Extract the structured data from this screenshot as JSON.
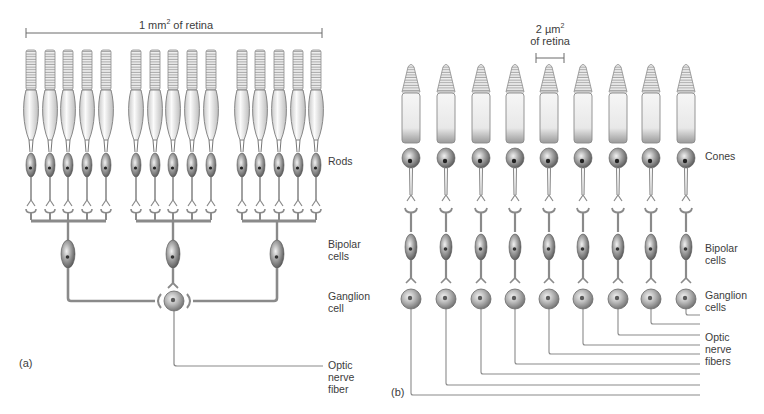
{
  "panel_a": {
    "letter": "(a)",
    "scale_label_prefix": "1 mm",
    "scale_label_sup": "2",
    "scale_label_suffix": " of retina",
    "labels": {
      "rods": "Rods",
      "bipolar": "Bipolar\ncells",
      "ganglion": "Ganglion\ncell",
      "optic": "Optic\nnerve\nfiber"
    },
    "rod_groups": 3,
    "rods_per_group": 5,
    "bipolar_count": 3,
    "ganglion_count": 1
  },
  "panel_b": {
    "letter": "(b)",
    "scale_label_line1_prefix": "2 µm",
    "scale_label_sup": "2",
    "scale_label_line2": "of retina",
    "labels": {
      "cones": "Cones",
      "bipolar": "Bipolar\ncells",
      "ganglion": "Ganglion\ncells",
      "optic": "Optic\nnerve\nfibers"
    },
    "cone_count": 9,
    "bipolar_count": 9,
    "ganglion_count": 9
  },
  "colors": {
    "line": "#8a8a8a",
    "cell_dark": "#6e6e6e",
    "cell_light": "#d8d8d8",
    "segment_fill": "#f4f4f4",
    "text": "#3c3c3c"
  }
}
